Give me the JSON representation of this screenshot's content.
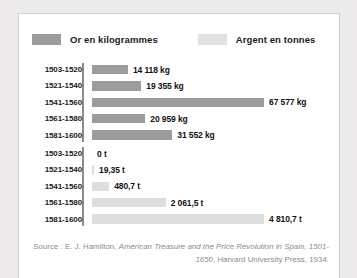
{
  "legend": {
    "items": [
      {
        "label": "Or en kilogrammes",
        "color": "#9c9c9c",
        "swatch_name": "gold-swatch"
      },
      {
        "label": "Argent en tonnes",
        "color": "#dedede",
        "swatch_name": "silver-swatch"
      }
    ]
  },
  "source": {
    "prefix": "Source : E. J. Hamilton, ",
    "title_italic": "American Treasure and the Price Revolution in Spain, 1501-1650",
    "suffix": ", Harvard University Press, 1934."
  },
  "chart_data": {
    "type": "bar",
    "orientation": "horizontal",
    "title": "",
    "xlabel": "",
    "ylabel": "",
    "grid": false,
    "legend_position": "top",
    "categories": [
      "1503-1520",
      "1521-1540",
      "1541-1560",
      "1561-1580",
      "1581-1600"
    ],
    "panels": [
      {
        "name": "Or en kilogrammes",
        "unit": "kg",
        "color": "#9c9c9c",
        "xlim": [
          0,
          67577
        ],
        "values": [
          14118,
          19355,
          67577,
          20959,
          31552
        ],
        "labels": [
          "14 118 kg",
          "19 355 kg",
          "67 577 kg",
          "20 959 kg",
          "31 552 kg"
        ]
      },
      {
        "name": "Argent en tonnes",
        "unit": "t",
        "color": "#dedede",
        "xlim": [
          0,
          4810.7
        ],
        "values": [
          0,
          19.35,
          480.7,
          2061.5,
          4810.7
        ],
        "labels": [
          "0 t",
          "19,35 t",
          "480,7 t",
          "2 061,5 t",
          "4 810,7 t"
        ]
      }
    ]
  }
}
